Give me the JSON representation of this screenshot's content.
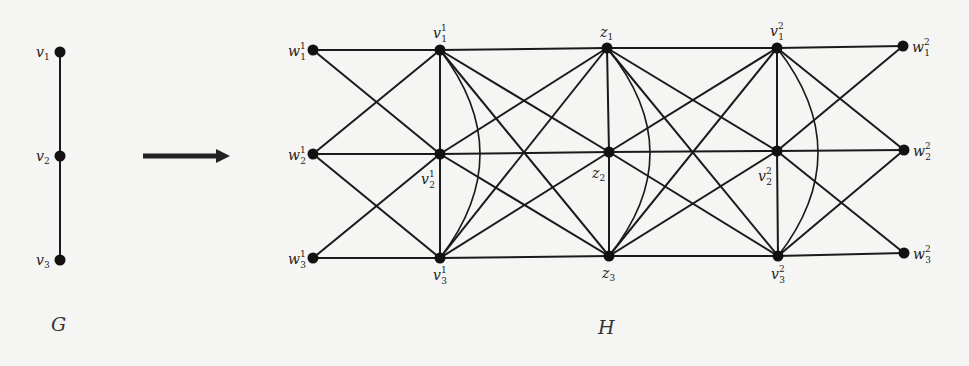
{
  "graph_G": {
    "caption": "G",
    "nodes": [
      {
        "id": "v1",
        "base": "v",
        "sub": "1",
        "sup": "",
        "x": 60,
        "y": 52,
        "lx": 36,
        "ly": 57
      },
      {
        "id": "v2",
        "base": "v",
        "sub": "2",
        "sup": "",
        "x": 60,
        "y": 156,
        "lx": 36,
        "ly": 161
      },
      {
        "id": "v3",
        "base": "v",
        "sub": "3",
        "sup": "",
        "x": 60,
        "y": 260,
        "lx": 36,
        "ly": 265
      }
    ],
    "edges": [
      [
        "v1",
        "v2"
      ],
      [
        "v2",
        "v3"
      ]
    ],
    "caption_pos": {
      "x": 51,
      "y": 331
    }
  },
  "arrow": {
    "x1": 143,
    "x2": 230,
    "y": 156,
    "color": "#222222"
  },
  "graph_H": {
    "caption": "H",
    "caption_pos": {
      "x": 598,
      "y": 334
    },
    "nodes": [
      {
        "id": "w11",
        "base": "w",
        "sub": "1",
        "sup": "1",
        "x": 313,
        "y": 50,
        "lx": 288,
        "ly": 56
      },
      {
        "id": "w21",
        "base": "w",
        "sub": "2",
        "sup": "1",
        "x": 313,
        "y": 154,
        "lx": 288,
        "ly": 160
      },
      {
        "id": "w31",
        "base": "w",
        "sub": "3",
        "sup": "1",
        "x": 313,
        "y": 258,
        "lx": 288,
        "ly": 264
      },
      {
        "id": "v11",
        "base": "v",
        "sub": "1",
        "sup": "1",
        "x": 440,
        "y": 50,
        "lx": 433,
        "ly": 38
      },
      {
        "id": "v21",
        "base": "v",
        "sub": "2",
        "sup": "1",
        "x": 440,
        "y": 154,
        "lx": 421,
        "ly": 184
      },
      {
        "id": "v31",
        "base": "v",
        "sub": "3",
        "sup": "1",
        "x": 440,
        "y": 258,
        "lx": 433,
        "ly": 280
      },
      {
        "id": "z1",
        "base": "z",
        "sub": "1",
        "sup": "",
        "x": 607,
        "y": 48,
        "lx": 600,
        "ly": 37
      },
      {
        "id": "z2",
        "base": "z",
        "sub": "2",
        "sup": "",
        "x": 609,
        "y": 152,
        "lx": 592,
        "ly": 178
      },
      {
        "id": "z3",
        "base": "z",
        "sub": "3",
        "sup": "",
        "x": 609,
        "y": 256,
        "lx": 602,
        "ly": 278
      },
      {
        "id": "v12",
        "base": "v",
        "sub": "1",
        "sup": "2",
        "x": 777,
        "y": 48,
        "lx": 770,
        "ly": 36
      },
      {
        "id": "v22",
        "base": "v",
        "sub": "2",
        "sup": "2",
        "x": 777,
        "y": 151,
        "lx": 758,
        "ly": 181
      },
      {
        "id": "v32",
        "base": "v",
        "sub": "3",
        "sup": "2",
        "x": 778,
        "y": 256,
        "lx": 771,
        "ly": 279
      },
      {
        "id": "w12",
        "base": "w",
        "sub": "1",
        "sup": "2",
        "x": 903,
        "y": 46,
        "lx": 912,
        "ly": 52
      },
      {
        "id": "w22",
        "base": "w",
        "sub": "2",
        "sup": "2",
        "x": 904,
        "y": 150,
        "lx": 913,
        "ly": 156
      },
      {
        "id": "w32",
        "base": "w",
        "sub": "3",
        "sup": "2",
        "x": 904,
        "y": 253,
        "lx": 913,
        "ly": 259
      }
    ],
    "edges": [
      [
        "w11",
        "v11"
      ],
      [
        "w21",
        "v21"
      ],
      [
        "w31",
        "v31"
      ],
      [
        "w11",
        "v21"
      ],
      [
        "w21",
        "v11"
      ],
      [
        "w21",
        "v31"
      ],
      [
        "w31",
        "v21"
      ],
      [
        "v11",
        "v21"
      ],
      [
        "v21",
        "v31"
      ],
      [
        "v11",
        "z1"
      ],
      [
        "v21",
        "z2"
      ],
      [
        "v31",
        "z3"
      ],
      [
        "v11",
        "z2"
      ],
      [
        "v11",
        "z3"
      ],
      [
        "v21",
        "z1"
      ],
      [
        "v21",
        "z3"
      ],
      [
        "v31",
        "z1"
      ],
      [
        "v31",
        "z2"
      ],
      [
        "z1",
        "z2"
      ],
      [
        "z2",
        "z3"
      ],
      [
        "z1",
        "v12"
      ],
      [
        "z2",
        "v22"
      ],
      [
        "z3",
        "v32"
      ],
      [
        "z1",
        "v22"
      ],
      [
        "z1",
        "v32"
      ],
      [
        "z2",
        "v12"
      ],
      [
        "z2",
        "v32"
      ],
      [
        "z3",
        "v12"
      ],
      [
        "z3",
        "v22"
      ],
      [
        "v12",
        "v22"
      ],
      [
        "v22",
        "v32"
      ],
      [
        "v12",
        "w12"
      ],
      [
        "v22",
        "w22"
      ],
      [
        "v32",
        "w32"
      ],
      [
        "v12",
        "w22"
      ],
      [
        "v22",
        "w12"
      ],
      [
        "v22",
        "w32"
      ],
      [
        "v32",
        "w22"
      ]
    ],
    "curves": [
      {
        "from": "v11",
        "to": "v31",
        "bulge_x": 480
      },
      {
        "from": "z1",
        "to": "z3",
        "bulge_x": 650
      },
      {
        "from": "v12",
        "to": "v32",
        "bulge_x": 818
      }
    ]
  },
  "style": {
    "edge_color": "#1a1a1a",
    "node_color": "#111111",
    "background": "#f5f5f3"
  }
}
